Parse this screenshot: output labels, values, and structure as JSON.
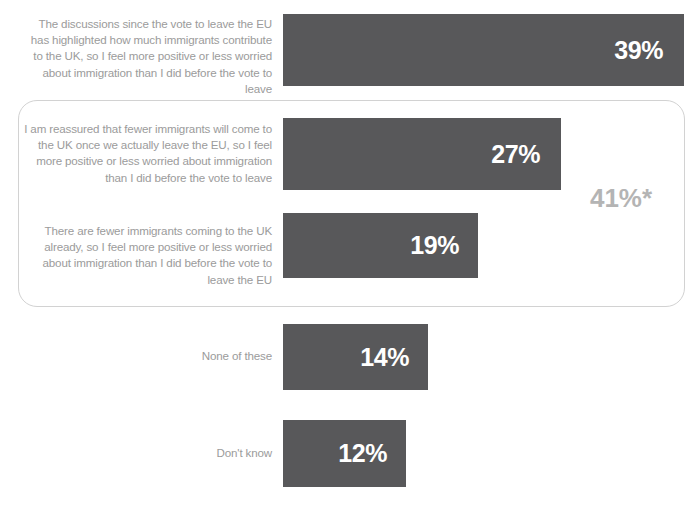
{
  "chart_data": {
    "type": "bar",
    "orientation": "horizontal",
    "title": "",
    "subtitle": "",
    "xlabel": "",
    "ylabel": "",
    "grid": false,
    "legend": null,
    "xlim": [
      0,
      100
    ],
    "value_suffix": "%",
    "categories": [
      "The discussions since the vote to leave the EU has highlighted how much immigrants contribute to the UK, so I feel more positive or less worried about immigration than I did before the vote to leave",
      "I am reassured that fewer immigrants will come to the UK once we actually leave the EU, so I feel more positive or less worried about immigration than I did before the vote to leave",
      "There are fewer immigrants coming to the UK already, so I feel more positive or less worried about immigration than I did before the vote to leave the EU",
      "None of these",
      "Don't know"
    ],
    "values": [
      39,
      27,
      19,
      14,
      12
    ],
    "value_labels": [
      "39%",
      "27%",
      "19%",
      "14%",
      "12%"
    ],
    "annotations": [
      {
        "name": "group-total",
        "text": "41%*",
        "description": "Combined total for the two bracketed statements (27% and 19%)",
        "applies_to": [
          1,
          2
        ]
      }
    ],
    "colors": {
      "bar": "#58585a",
      "bar_value_text": "#ffffff",
      "category_label_text": "#9b9b9b",
      "group_box_border": "#d2d2d2",
      "group_total_text": "#b4b4b4",
      "background": "#ffffff"
    }
  },
  "rows": [
    {
      "label": "The discussions since the vote to leave the EU has highlighted how much immigrants contribute to the UK, so I feel more positive or less worried about immigration than I did before the vote to leave",
      "value_label": "39%"
    },
    {
      "label": "I am reassured that fewer immigrants will come to the UK once we actually leave the EU, so I feel more positive or less worried about immigration than I did before the vote to leave",
      "value_label": "27%"
    },
    {
      "label": "There are fewer immigrants coming to the UK already, so I feel more positive or less worried about immigration than I did before the vote to leave the EU",
      "value_label": "19%"
    },
    {
      "label": "None of these",
      "value_label": "14%"
    },
    {
      "label": "Don't know",
      "value_label": "12%"
    }
  ],
  "group": {
    "total_label": "41%*"
  }
}
